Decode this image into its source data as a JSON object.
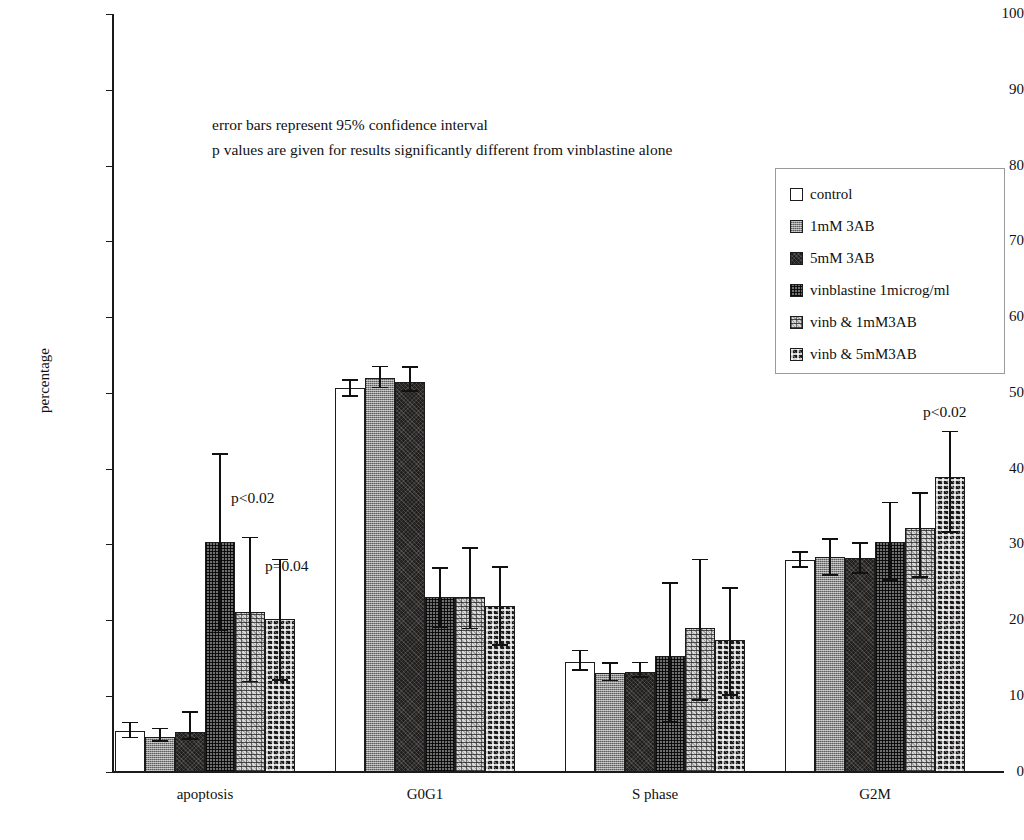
{
  "chart_data": {
    "type": "bar",
    "title": "",
    "xlabel": "",
    "ylabel": "percentage",
    "ylim": [
      0,
      100
    ],
    "ytick_step": 10,
    "yticks": [
      "100",
      "90",
      "80",
      "70",
      "60",
      "50",
      "40",
      "30",
      "20",
      "10",
      "0"
    ],
    "grid": false,
    "legend_position": "top-right-inside",
    "categories": [
      "apoptosis",
      "G0G1",
      "S phase",
      "G2M"
    ],
    "series": [
      {
        "name": "control",
        "values": [
          5.3,
          50.6,
          14.4,
          27.9
        ],
        "err_low": [
          4.4,
          49.5,
          13.3,
          26.9
        ],
        "err_high": [
          6.6,
          51.8,
          16.1,
          29.1
        ]
      },
      {
        "name": "1mM 3AB",
        "values": [
          4.6,
          52.0,
          13.0,
          28.3
        ],
        "err_low": [
          3.9,
          50.6,
          11.9,
          25.8
        ],
        "err_high": [
          5.8,
          53.6,
          14.4,
          30.8
        ]
      },
      {
        "name": "5mM 3AB",
        "values": [
          5.2,
          51.4,
          13.2,
          28.2
        ],
        "err_low": [
          4.2,
          50.1,
          12.4,
          26.1
        ],
        "err_high": [
          8.0,
          53.5,
          14.5,
          30.3
        ]
      },
      {
        "name": "vinblastine 1microg/ml",
        "values": [
          30.3,
          23.0,
          15.2,
          30.3
        ],
        "err_low": [
          18.5,
          19.0,
          6.5,
          25.2
        ],
        "err_high": [
          42.0,
          27.0,
          25.0,
          35.6
        ]
      },
      {
        "name": "vinb & 1mM3AB",
        "values": [
          21.0,
          23.0,
          19.0,
          32.1
        ],
        "err_low": [
          11.8,
          18.8,
          9.3,
          25.6
        ],
        "err_high": [
          31.0,
          29.6,
          28.1,
          36.9
        ]
      },
      {
        "name": "vinb & 5mM3AB",
        "values": [
          20.2,
          21.8,
          17.3,
          38.9
        ],
        "err_low": [
          12.0,
          16.6,
          10.0,
          31.5
        ],
        "err_high": [
          28.1,
          27.1,
          24.3,
          45.0
        ]
      }
    ],
    "annotations": [
      "error bars represent 95% confidence interval",
      "p values are given for results significantly different from vinblastine alone"
    ],
    "pvalue_labels": [
      {
        "text": "p<0.02",
        "category": "apoptosis",
        "series": "vinblastine 1microg/ml"
      },
      {
        "text": "p=0.04",
        "category": "apoptosis",
        "series": "vinb & 1mM3AB"
      },
      {
        "text": "p<0.02",
        "category": "G2M",
        "series": "vinb & 5mM3AB"
      }
    ]
  },
  "legend": {
    "items": [
      {
        "label": "control",
        "swatch": "swatch-control"
      },
      {
        "label": "1mM 3AB",
        "swatch": "swatch-1mm-3ab"
      },
      {
        "label": "5mM 3AB",
        "swatch": "swatch-5mm-3ab"
      },
      {
        "label": "vinblastine 1microg/ml",
        "swatch": "swatch-vinblastine"
      },
      {
        "label": "vinb & 1mM3AB",
        "swatch": "swatch-vinb-1mm3ab"
      },
      {
        "label": "vinb & 5mM3AB",
        "swatch": "swatch-vinb-5mm3ab"
      }
    ]
  }
}
